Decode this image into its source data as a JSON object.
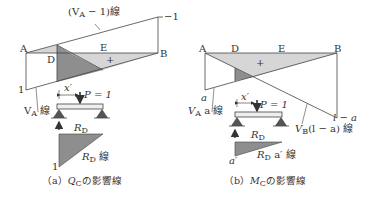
{
  "figure_a": {
    "caption_prefix": "（a）",
    "caption_symbol": "Q",
    "caption_sub": "C",
    "caption_suffix": "の影響線",
    "label_va_minus_1": "(V",
    "label_va_minus_1_sub": "A",
    "label_va_minus_1_tail": " − 1)線",
    "label_minus_one": "−1",
    "point_a": "A",
    "point_b": "B",
    "point_d": "D",
    "point_e": "E",
    "plus_sign": "+",
    "value_one": "1",
    "label_va_line": "V",
    "label_va_line_sub": "A",
    "label_va_line_tail": " 線",
    "label_x_prime": "x′",
    "label_load": "P = 1",
    "label_rd": "R",
    "label_rd_sub": "D",
    "label_rd_line": "R",
    "label_rd_line_sub": "D",
    "label_rd_line_tail": " 線",
    "value_one_bottom": "1"
  },
  "figure_b": {
    "caption_prefix": "（b）",
    "caption_symbol": "M",
    "caption_sub": "C",
    "caption_suffix": "の影響線",
    "point_a": "A",
    "point_b": "B",
    "point_d": "D",
    "point_e": "E",
    "plus_sign": "+",
    "value_a": "a",
    "label_va_a_line": "V",
    "label_va_a_line_sub": "A",
    "label_va_a_line_tail": " a 線",
    "label_x_prime": "x′",
    "label_load": "P = 1",
    "label_vb_line": "V",
    "label_vb_line_sub": "B",
    "label_vb_line_tail": "(l − a) 線",
    "value_l_minus_a": "l − a",
    "label_rd": "R",
    "label_rd_sub": "D",
    "label_rd_line": "R",
    "label_rd_line_sub": "D",
    "label_rd_line_tail": " a′ 線",
    "value_a_prime": "a′"
  },
  "colors": {
    "light_fill": "#d4d4d4",
    "dark_fill": "#8a8a8a",
    "line": "#444444",
    "support": "#555555"
  }
}
